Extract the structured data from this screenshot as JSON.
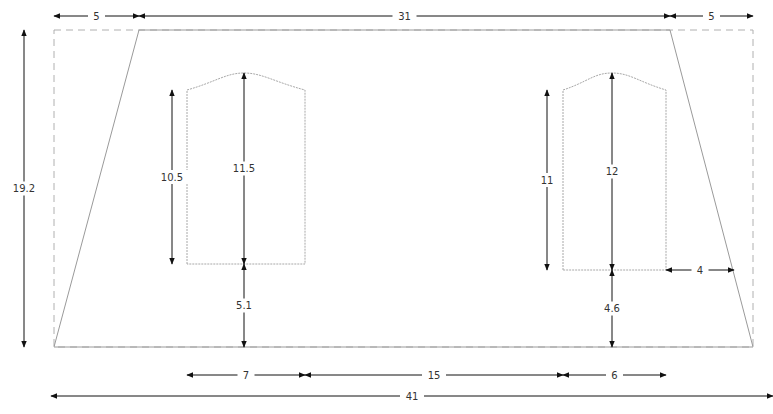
{
  "diagram": {
    "colors": {
      "line": "#111111",
      "outline": "#9a9a9a",
      "dashed": "#b0b0b0",
      "text": "#333333"
    },
    "bounding_box": {
      "x1": 54,
      "y1": 30,
      "x2": 753,
      "y2": 347
    },
    "trapezoid": {
      "top_left": [
        139,
        30
      ],
      "top_right": [
        670,
        30
      ],
      "bottom_right": [
        753,
        347
      ],
      "bottom_left": [
        54,
        347
      ]
    },
    "windows": [
      {
        "name": "left-window",
        "x1": 187,
        "x2": 305,
        "top_side_y": 90,
        "peak_y": 73,
        "bottom_y": 264,
        "peak_x": 244
      },
      {
        "name": "right-window",
        "x1": 563,
        "x2": 666,
        "top_side_y": 90,
        "peak_y": 73,
        "bottom_y": 270,
        "peak_x": 612
      }
    ],
    "dimensions": [
      {
        "name": "top-left-offset",
        "label": "5",
        "orient": "h",
        "x1": 54,
        "x2": 139,
        "y": 16
      },
      {
        "name": "top-width",
        "label": "31",
        "orient": "h",
        "x1": 139,
        "x2": 670,
        "y": 16
      },
      {
        "name": "top-right-offset",
        "label": "5",
        "orient": "h",
        "x1": 670,
        "x2": 753,
        "y": 16
      },
      {
        "name": "total-height",
        "label": "19.2",
        "orient": "v",
        "y1": 30,
        "y2": 347,
        "x": 24
      },
      {
        "name": "left-window-side-height",
        "label": "10.5",
        "orient": "v",
        "y1": 90,
        "y2": 264,
        "x": 172
      },
      {
        "name": "left-window-peak-height",
        "label": "11.5",
        "orient": "v",
        "y1": 73,
        "y2": 264,
        "x": 244
      },
      {
        "name": "left-window-sill-height",
        "label": "5.1",
        "orient": "v",
        "y1": 264,
        "y2": 347,
        "x": 244
      },
      {
        "name": "right-window-side-height",
        "label": "11",
        "orient": "v",
        "y1": 90,
        "y2": 270,
        "x": 547
      },
      {
        "name": "right-window-peak-height",
        "label": "12",
        "orient": "v",
        "y1": 73,
        "y2": 270,
        "x": 612
      },
      {
        "name": "right-window-sill-height",
        "label": "4.6",
        "orient": "v",
        "y1": 270,
        "y2": 347,
        "x": 612
      },
      {
        "name": "right-window-edge-offset",
        "label": "4",
        "orient": "h",
        "x1": 666,
        "x2": 734,
        "y": 270
      },
      {
        "name": "left-window-width",
        "label": "7",
        "orient": "h",
        "x1": 187,
        "x2": 305,
        "y": 375
      },
      {
        "name": "window-gap",
        "label": "15",
        "orient": "h",
        "x1": 305,
        "x2": 563,
        "y": 375
      },
      {
        "name": "right-window-width",
        "label": "6",
        "orient": "h",
        "x1": 563,
        "x2": 666,
        "y": 375
      },
      {
        "name": "bottom-width",
        "label": "41",
        "orient": "h",
        "x1": 51,
        "x2": 773,
        "y": 396
      }
    ]
  }
}
